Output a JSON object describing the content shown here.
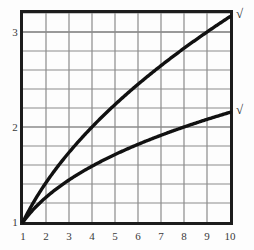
{
  "chart_data": {
    "type": "line",
    "title": "",
    "subtitle": "",
    "xlabel": "",
    "ylabel": "",
    "xlim": [
      1,
      10
    ],
    "ylim": [
      1,
      3.2
    ],
    "grid": true,
    "legend_position": "curve-end-right",
    "x_ticks": [
      "1",
      "2",
      "3",
      "4",
      "5",
      "6",
      "7",
      "8",
      "9",
      "10"
    ],
    "x_tick_values": [
      1,
      2,
      3,
      4,
      5,
      6,
      7,
      8,
      9,
      10
    ],
    "y_ticks": [
      "1",
      "2",
      "3"
    ],
    "y_tick_values": [
      1,
      2,
      3
    ],
    "y_minor_gridline_values": [
      1.2,
      1.4,
      1.6,
      1.8,
      2.2,
      2.4,
      2.6,
      2.8,
      3.0,
      3.2
    ],
    "x": [
      1,
      2,
      3,
      4,
      5,
      6,
      7,
      8,
      9,
      10
    ],
    "series": [
      {
        "name": "square-root",
        "label": "√",
        "color": "#111111",
        "values": [
          1.0,
          1.41,
          1.73,
          2.0,
          2.24,
          2.45,
          2.65,
          2.83,
          3.0,
          3.16
        ],
        "label_value": "3.16",
        "exponent": 0.5
      },
      {
        "name": "cube-root",
        "label": "√",
        "color": "#111111",
        "values": [
          1.0,
          1.26,
          1.44,
          1.59,
          1.71,
          1.82,
          1.91,
          2.0,
          2.08,
          2.15
        ],
        "label_value": "2.15",
        "exponent": 0.3333333
      }
    ],
    "colors": {
      "background": "#fdfdfd",
      "grid": "#8b8b8b",
      "frame": "#1c1c1c",
      "curve": "#111111",
      "tick_label": "#3a3a3a"
    }
  }
}
